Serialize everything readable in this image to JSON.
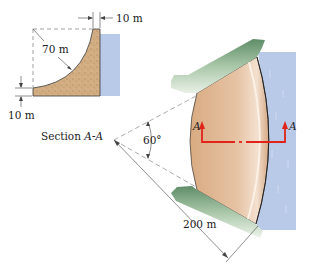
{
  "section_view": {
    "caption_prefix": "Section ",
    "caption_italic": "A-A",
    "crest_width_label": "10 m",
    "base_height_label": "10 m",
    "radius_label": "70 m"
  },
  "plan_view": {
    "angle_label": "60°",
    "radius_label": "200 m",
    "section_marker_left": "A",
    "section_marker_right": "A"
  },
  "colors": {
    "dam_fill": "#dcb48e",
    "dam_section_fill": "#d2ad82",
    "water": "#b9c9e8",
    "ground": "#7fa682",
    "section_line": "#e2231a",
    "dim_line": "#444444"
  }
}
